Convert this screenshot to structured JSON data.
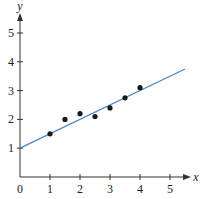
{
  "chart_data": {
    "type": "scatter",
    "title": "",
    "xlabel": "x",
    "ylabel": "y",
    "xlim": [
      0,
      5.5
    ],
    "ylim": [
      0,
      5.6
    ],
    "x_ticks": [
      "0",
      "1",
      "2",
      "3",
      "4",
      "5"
    ],
    "y_ticks": [
      "1",
      "2",
      "3",
      "4",
      "5"
    ],
    "grid": false,
    "legend": null,
    "series": [
      {
        "name": "data points",
        "type": "scatter",
        "color": "#1a1a1a",
        "x": [
          1,
          1.5,
          2,
          2.5,
          3,
          3.5,
          4
        ],
        "y": [
          1.5,
          2.0,
          2.2,
          2.1,
          2.4,
          2.75,
          3.1
        ]
      },
      {
        "name": "fitted line",
        "type": "line",
        "color": "#4a86c8",
        "x": [
          0,
          5.5
        ],
        "y": [
          1.0,
          3.75
        ],
        "equation": "y = 0.5x + 1"
      }
    ]
  }
}
